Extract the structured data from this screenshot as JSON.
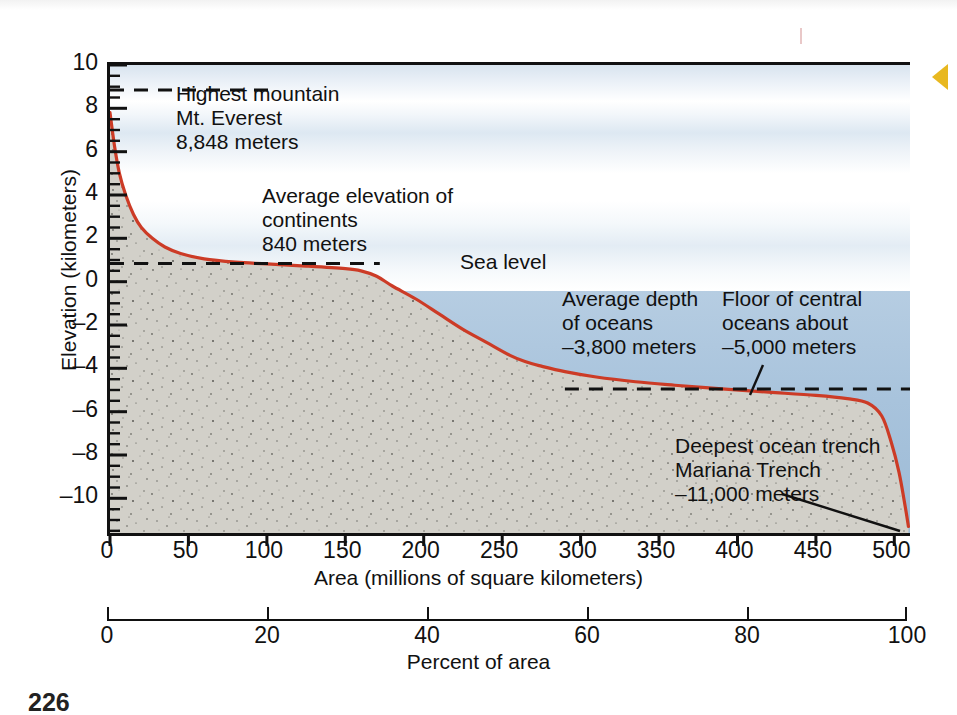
{
  "figure": {
    "page_number": "226",
    "gold_marker": "gold-triangle-marker"
  },
  "axes": {
    "y": {
      "title": "Elevation (kilometers)",
      "ticks": [
        10,
        8,
        6,
        4,
        2,
        0,
        -2,
        -4,
        -6,
        -8,
        -10
      ],
      "tick_labels": [
        "10",
        "8",
        "6",
        "4",
        "2",
        "0",
        "–2",
        "–4",
        "–6",
        "–8",
        "–10"
      ],
      "min": -11.6,
      "max": 10
    },
    "x": {
      "title": "Area (millions of square kilometers)",
      "ticks": [
        0,
        50,
        100,
        150,
        200,
        250,
        300,
        350,
        400,
        450,
        500
      ],
      "tick_labels": [
        "0",
        "50",
        "100",
        "150",
        "200",
        "250",
        "300",
        "350",
        "400",
        "450",
        "500"
      ],
      "min": 0,
      "max": 510
    },
    "x2": {
      "title": "Percent of area",
      "ticks": [
        0,
        20,
        40,
        60,
        80,
        100
      ],
      "tick_labels": [
        "0",
        "20",
        "40",
        "60",
        "80",
        "100"
      ],
      "min": 0,
      "max": 100
    }
  },
  "annotations": [
    {
      "name": "everest-annotation",
      "lines": [
        "Highest mountain",
        "Mt. Everest",
        "8,848 meters"
      ],
      "value_km": 8.848,
      "left": 176,
      "top": 82
    },
    {
      "name": "continents-annotation",
      "lines": [
        "Average elevation of",
        "continents",
        "840 meters"
      ],
      "value_km": 0.84,
      "left": 262,
      "top": 184
    },
    {
      "name": "sea-level-annotation",
      "lines": [
        "Sea level"
      ],
      "value_km": 0,
      "left": 460,
      "top": 250
    },
    {
      "name": "average-ocean-depth-annotation",
      "lines": [
        "Average depth",
        "of oceans",
        "–3,800 meters"
      ],
      "value_km": -3.8,
      "left": 562,
      "top": 287
    },
    {
      "name": "central-ocean-floor-annotation",
      "lines": [
        "Floor of central",
        "oceans about",
        "–5,000 meters"
      ],
      "value_km": -5.0,
      "left": 722,
      "top": 287
    },
    {
      "name": "mariana-trench-annotation",
      "lines": [
        "Deepest ocean trench",
        "Mariana Trench",
        "–11,000 meters"
      ],
      "value_km": -11.0,
      "left": 675,
      "top": 434
    }
  ],
  "colors": {
    "curve": "#cc3b26",
    "sky_top": "#d8e4ef",
    "sky_bottom": "#ffffff",
    "water": "#a8c3dc",
    "rock": "#cfcdc6",
    "axis": "#111111",
    "marker_gold": "#e8b820"
  },
  "chart_data": {
    "type": "line",
    "xlabel": "Area (millions of square kilometers)",
    "ylabel": "Elevation (kilometers)",
    "x2label": "Percent of area",
    "xlim": [
      0,
      510
    ],
    "ylim": [
      -11.6,
      10
    ],
    "x2lim": [
      0,
      100
    ],
    "grid": false,
    "legend": "none",
    "series": [
      {
        "name": "Cumulative area vs. elevation",
        "x": [
          0,
          3,
          6,
          10,
          15,
          20,
          27,
          35,
          45,
          60,
          80,
          100,
          125,
          150,
          160,
          170,
          180,
          195,
          210,
          225,
          240,
          255,
          265,
          275,
          290,
          310,
          335,
          360,
          390,
          420,
          450,
          470,
          483,
          492,
          498,
          503,
          507,
          509
        ],
        "y": [
          7.8,
          6.2,
          5.0,
          4.0,
          3.1,
          2.5,
          2.0,
          1.6,
          1.3,
          1.05,
          0.9,
          0.82,
          0.72,
          0.6,
          0.5,
          0.25,
          -0.2,
          -0.8,
          -1.5,
          -2.2,
          -2.8,
          -3.4,
          -3.7,
          -3.9,
          -4.15,
          -4.4,
          -4.62,
          -4.78,
          -4.95,
          -5.1,
          -5.25,
          -5.4,
          -5.6,
          -6.2,
          -7.4,
          -8.8,
          -10.4,
          -11.3
        ]
      }
    ],
    "reference_lines": [
      {
        "label": "Highest mountain Mt. Everest 8,848 meters",
        "y": 8.848,
        "x_start": 0,
        "x_end": 105,
        "style": "dashed"
      },
      {
        "label": "Average elevation of continents 840 meters",
        "y": 0.84,
        "x_start": 0,
        "x_end": 172,
        "style": "dashed"
      },
      {
        "label": "Floor of central oceans about –5,000 meters",
        "y": -4.95,
        "x_start": 290,
        "x_end": 510,
        "style": "dashed"
      }
    ],
    "callout_values": {
      "mt_everest_m": 8848,
      "average_continent_elevation_m": 840,
      "average_ocean_depth_m": -3800,
      "central_ocean_floor_m": -5000,
      "mariana_trench_m": -11000
    }
  }
}
